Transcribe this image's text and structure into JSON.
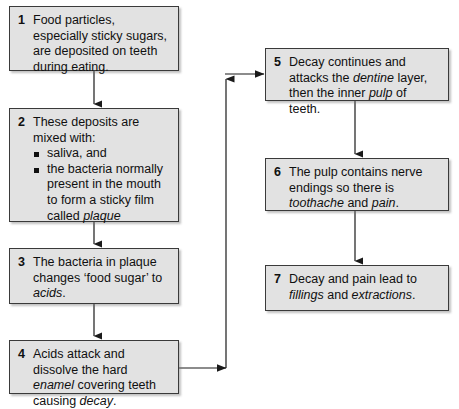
{
  "diagram": {
    "box_fill": "#e2e2e2",
    "box_border": "#3a3a3a",
    "connector_color": "#1a1a1a",
    "nodes": [
      {
        "number": "1",
        "text": "Food particles, especially sticky sugars, are deposited on teeth during eating.",
        "segments": [
          {
            "text": "Food particles, especially sticky sugars, are deposited on teeth during eating.",
            "style": "normal"
          }
        ]
      },
      {
        "number": "2",
        "text": "These deposits are mixed with: saliva, and the bacteria normally present in the mouth to form a sticky film called plaque",
        "lead": "These deposits are mixed with:",
        "bullets": [
          {
            "text": "saliva, and"
          },
          {
            "text": "the bacteria normally present in the mouth to form a sticky film called plaque",
            "italic_tail": "plaque"
          }
        ]
      },
      {
        "number": "3",
        "text": "The bacteria in plaque changes ‘food sugar’ to acids.",
        "segments": [
          {
            "text": "The bacteria in plaque changes ‘food sugar’ to ",
            "style": "normal"
          },
          {
            "text": "acids",
            "style": "italic"
          },
          {
            "text": ".",
            "style": "normal"
          }
        ]
      },
      {
        "number": "4",
        "text": "Acids attack and dissolve the hard enamel covering teeth causing decay.",
        "segments": [
          {
            "text": "Acids attack and dissolve the hard ",
            "style": "normal"
          },
          {
            "text": "enamel",
            "style": "italic"
          },
          {
            "text": " covering teeth causing ",
            "style": "normal"
          },
          {
            "text": "decay",
            "style": "italic"
          },
          {
            "text": ".",
            "style": "normal"
          }
        ]
      },
      {
        "number": "5",
        "text": "Decay continues and attacks the dentine layer, then the inner pulp of teeth.",
        "segments": [
          {
            "text": "Decay continues and attacks the ",
            "style": "normal"
          },
          {
            "text": "dentine",
            "style": "italic"
          },
          {
            "text": " layer, then the inner ",
            "style": "normal"
          },
          {
            "text": "pulp",
            "style": "italic"
          },
          {
            "text": " of teeth.",
            "style": "normal"
          }
        ]
      },
      {
        "number": "6",
        "text": "The pulp contains nerve endings so there is toothache and pain.",
        "segments": [
          {
            "text": "The pulp contains nerve endings so there is ",
            "style": "normal"
          },
          {
            "text": "toothache",
            "style": "italic"
          },
          {
            "text": " and ",
            "style": "normal"
          },
          {
            "text": "pain",
            "style": "italic"
          },
          {
            "text": ".",
            "style": "normal"
          }
        ]
      },
      {
        "number": "7",
        "text": "Decay and pain lead to fillings and extractions.",
        "segments": [
          {
            "text": "Decay and pain lead to ",
            "style": "normal"
          },
          {
            "text": "fillings",
            "style": "italic"
          },
          {
            "text": " and ",
            "style": "normal"
          },
          {
            "text": "extractions",
            "style": "italic"
          },
          {
            "text": ".",
            "style": "normal"
          }
        ]
      }
    ],
    "edges": [
      {
        "from": "1",
        "to": "2",
        "shape": "vertical"
      },
      {
        "from": "2",
        "to": "3",
        "shape": "vertical"
      },
      {
        "from": "3",
        "to": "4",
        "shape": "vertical"
      },
      {
        "from": "4",
        "to": "5",
        "shape": "right-up-right"
      },
      {
        "from": "5",
        "to": "6",
        "shape": "vertical"
      },
      {
        "from": "6",
        "to": "7",
        "shape": "vertical"
      }
    ]
  }
}
